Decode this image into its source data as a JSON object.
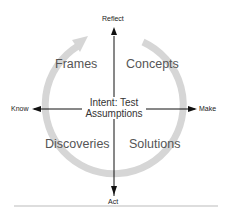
{
  "diagram": {
    "axes": {
      "top": "Reflect",
      "bottom": "Act",
      "left": "Know",
      "right": "Make"
    },
    "quadrants": {
      "top_left": "Frames",
      "top_right": "Concepts",
      "bottom_left": "Discoveries",
      "bottom_right": "Solutions"
    },
    "center": {
      "line1": "Intent: Test",
      "line2": "Assumptions"
    },
    "colors": {
      "cycle_arc": "#d4d4d4",
      "axis": "#111111",
      "divider": "#bbbbbb"
    }
  }
}
